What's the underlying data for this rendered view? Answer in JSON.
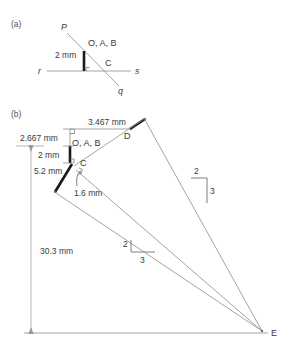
{
  "figure": {
    "background_color": "#ffffff",
    "line_color": "#8d8d8d",
    "bold_color": "#1a1a1a",
    "text_color": "#3a3a3a"
  },
  "parts": {
    "a": {
      "label": "(a)",
      "points": [
        {
          "name": "P",
          "label": "P"
        },
        {
          "name": "q",
          "label": "q"
        },
        {
          "name": "r",
          "label": "r"
        },
        {
          "name": "s",
          "label": "s"
        },
        {
          "name": "C",
          "label": "C"
        },
        {
          "name": "OAB",
          "label": "O, A, B"
        }
      ],
      "dimensions": [
        {
          "name": "vertical-2mm",
          "label": "2 mm"
        }
      ]
    },
    "b": {
      "label": "(b)",
      "points": [
        {
          "name": "D",
          "label": "D"
        },
        {
          "name": "E",
          "label": "E"
        },
        {
          "name": "C",
          "label": "C"
        },
        {
          "name": "OAB",
          "label": "O, A, B"
        }
      ],
      "dimensions": [
        {
          "name": "top-horizontal",
          "label": "3.467 mm"
        },
        {
          "name": "upper-vertical",
          "label": "2.667 mm"
        },
        {
          "name": "mid-vertical",
          "label": "2 mm"
        },
        {
          "name": "lower-bold",
          "label": "5.2 mm"
        },
        {
          "name": "short-leader",
          "label": "1.6 mm"
        },
        {
          "name": "overall-vertical",
          "label": "30.3 mm"
        }
      ],
      "slope_triangles": [
        {
          "name": "right-slope",
          "rise": "2",
          "run": "3"
        },
        {
          "name": "left-slope",
          "rise": "2",
          "run": "3"
        }
      ]
    }
  }
}
